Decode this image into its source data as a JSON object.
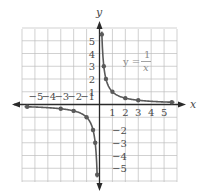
{
  "chart_data": {
    "type": "line",
    "title": "",
    "xlabel": "x",
    "ylabel": "y",
    "xlim": [
      -6,
      6
    ],
    "ylim": [
      -6,
      6
    ],
    "grid": true,
    "x_tick_labels_positive": [
      "1",
      "2",
      "3",
      "4",
      "5"
    ],
    "x_tick_labels_negative": [
      "−5",
      "−4",
      "−3",
      "−2",
      "−1"
    ],
    "y_tick_labels_positive": [
      "1",
      "2",
      "3",
      "4",
      "5"
    ],
    "y_tick_labels_negative": [
      "−2",
      "−3",
      "−4",
      "−5"
    ],
    "annotation": {
      "lhs": "y =",
      "numerator": "1",
      "denominator": "x"
    },
    "series": [
      {
        "name": "y = 1/x (x > 0)",
        "points": [
          [
            0.18,
            5.5
          ],
          [
            0.333,
            3
          ],
          [
            0.5,
            2
          ],
          [
            1,
            1
          ],
          [
            2,
            0.5
          ],
          [
            3,
            0.333
          ],
          [
            5.6,
            0.18
          ]
        ]
      },
      {
        "name": "y = 1/x (x < 0)",
        "points": [
          [
            -5.6,
            -0.18
          ],
          [
            -3,
            -0.333
          ],
          [
            -2,
            -0.5
          ],
          [
            -1,
            -1
          ],
          [
            -0.5,
            -2
          ],
          [
            -0.333,
            -3
          ],
          [
            -0.18,
            -5.5
          ]
        ]
      }
    ],
    "colors": {
      "curve": "#5a5a5a",
      "grid": "#bdbdbd",
      "axis": "#2a2a2a",
      "annotation": "#8a8a8a"
    }
  }
}
